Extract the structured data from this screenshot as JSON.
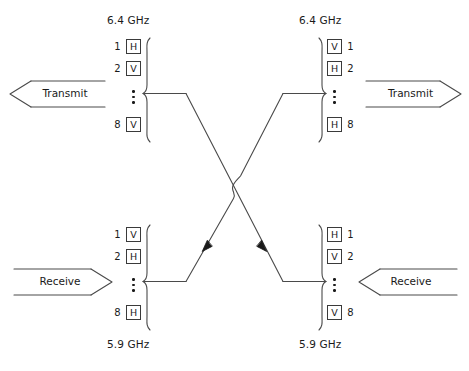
{
  "diagram": {
    "stroke_color": "#4a4a4a",
    "text_color": "#1a1a1a",
    "groups": {
      "top_left": {
        "freq": "6.4 GHz",
        "freq_position": "above",
        "number_side": "left",
        "ports": [
          {
            "index": "1",
            "pol": "H"
          },
          {
            "index": "2",
            "pol": "V"
          },
          {
            "index": "8",
            "pol": "V"
          }
        ],
        "ellipsis": "⋮",
        "arrow": {
          "label": "Transmit",
          "direction": "left"
        }
      },
      "top_right": {
        "freq": "6.4 GHz",
        "freq_position": "above",
        "number_side": "right",
        "ports": [
          {
            "index": "1",
            "pol": "V"
          },
          {
            "index": "2",
            "pol": "H"
          },
          {
            "index": "8",
            "pol": "H"
          }
        ],
        "ellipsis": "⋮",
        "arrow": {
          "label": "Transmit",
          "direction": "right"
        }
      },
      "bottom_left": {
        "freq": "5.9 GHz",
        "freq_position": "below",
        "number_side": "left",
        "ports": [
          {
            "index": "1",
            "pol": "V"
          },
          {
            "index": "2",
            "pol": "H"
          },
          {
            "index": "8",
            "pol": "H"
          }
        ],
        "ellipsis": "⋮",
        "arrow": {
          "label": "Receive",
          "direction": "right"
        }
      },
      "bottom_right": {
        "freq": "5.9 GHz",
        "freq_position": "below",
        "number_side": "right",
        "ports": [
          {
            "index": "1",
            "pol": "H"
          },
          {
            "index": "2",
            "pol": "V"
          },
          {
            "index": "8",
            "pol": "V"
          }
        ],
        "ellipsis": "⋮",
        "arrow": {
          "label": "Receive",
          "direction": "left"
        }
      }
    },
    "crossover": {
      "hop_symbol": "line-hop",
      "arrowheads": "on lower diagonals pointing toward center"
    }
  }
}
